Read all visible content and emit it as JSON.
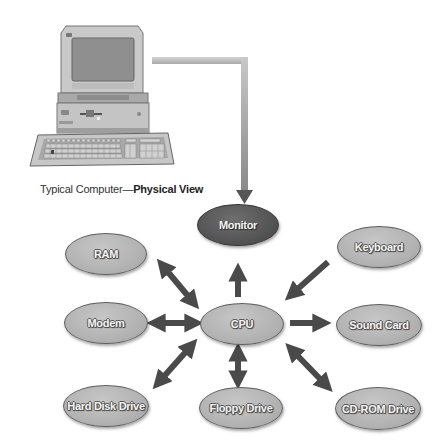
{
  "caption": {
    "prefix": "Typical Computer—",
    "bold": "Physical View"
  },
  "illustration": {
    "subject": "desktop computer with monitor, system unit and keyboard",
    "connector_target": "Monitor"
  },
  "nodes": {
    "ram": {
      "label": "RAM"
    },
    "monitor": {
      "label": "Monitor",
      "highlighted": true
    },
    "keyboard": {
      "label": "Keyboard"
    },
    "modem": {
      "label": "Modem"
    },
    "cpu": {
      "label": "CPU"
    },
    "sound_card": {
      "label": "Sound Card"
    },
    "hard_disk": {
      "label": "Hard Disk Drive"
    },
    "floppy": {
      "label": "Floppy Drive"
    },
    "cdrom": {
      "label": "CD-ROM Drive"
    }
  },
  "edges": [
    {
      "from": "CPU",
      "to": "Monitor",
      "direction": "to"
    },
    {
      "from": "Keyboard",
      "to": "CPU",
      "direction": "to"
    },
    {
      "from": "CPU",
      "to": "RAM",
      "direction": "both"
    },
    {
      "from": "CPU",
      "to": "Modem",
      "direction": "both"
    },
    {
      "from": "CPU",
      "to": "Sound Card",
      "direction": "to"
    },
    {
      "from": "CPU",
      "to": "Hard Disk Drive",
      "direction": "both"
    },
    {
      "from": "CPU",
      "to": "Floppy Drive",
      "direction": "both"
    },
    {
      "from": "CPU",
      "to": "CD-ROM Drive",
      "direction": "both"
    }
  ],
  "colors": {
    "node_fill": "#b5b5b5",
    "node_highlight_fill": "#555555",
    "arrow": "#4a4a4a",
    "connector": "#bdbdbd"
  }
}
